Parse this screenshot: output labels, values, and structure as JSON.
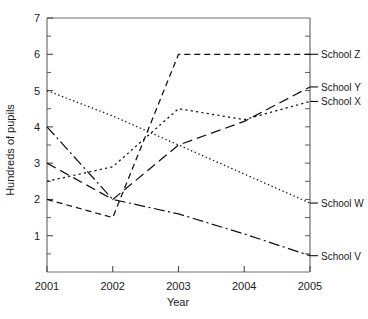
{
  "chart_data": {
    "type": "line",
    "title": "",
    "xlabel": "Year",
    "ylabel": "Hundreds of pupils",
    "categories": [
      "2001",
      "2002",
      "2003",
      "2004",
      "2005"
    ],
    "x": [
      2001,
      2002,
      2003,
      2004,
      2005
    ],
    "xlim": [
      2001,
      2005
    ],
    "ylim": [
      0,
      7
    ],
    "y_ticks": [
      "1",
      "2",
      "3",
      "4",
      "5",
      "6",
      "7"
    ],
    "y_tick_values": [
      1,
      2,
      3,
      4,
      5,
      6,
      7
    ],
    "y_minor_step": 0.5,
    "grid": false,
    "legend_position": "right-of-axis-inline-labels",
    "series": [
      {
        "name": "School Z",
        "label": "School Z",
        "dash": "short-dash",
        "values": [
          2.0,
          1.5,
          6.0,
          6.0,
          6.0
        ]
      },
      {
        "name": "School Y",
        "label": "School Y",
        "dash": "long-dash",
        "values": [
          3.0,
          2.0,
          3.5,
          4.15,
          5.1
        ]
      },
      {
        "name": "School X",
        "label": "School X",
        "dash": "loose-dotted",
        "values": [
          2.5,
          2.9,
          4.5,
          4.2,
          4.7
        ]
      },
      {
        "name": "School W",
        "label": "School W",
        "dash": "fine-dotted",
        "values": [
          5.0,
          4.3,
          3.5,
          2.7,
          1.9
        ]
      },
      {
        "name": "School V",
        "label": "School V",
        "dash": "dash-dot",
        "values": [
          4.0,
          2.0,
          1.6,
          1.05,
          0.45
        ]
      }
    ]
  },
  "axes": {
    "x_label": "Year",
    "y_label": "Hundreds of pupils",
    "x_tick_labels": [
      "2001",
      "2002",
      "2003",
      "2004",
      "2005"
    ],
    "y_tick_labels": [
      "1",
      "2",
      "3",
      "4",
      "5",
      "6",
      "7"
    ]
  },
  "series_labels": {
    "z": "School Z",
    "y": "School Y",
    "x": "School X",
    "w": "School W",
    "v": "School V"
  }
}
